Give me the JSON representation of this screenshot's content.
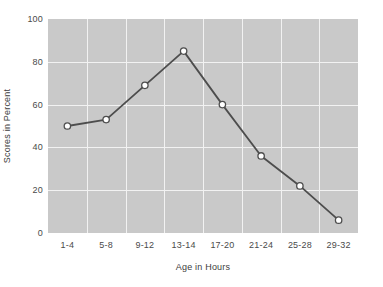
{
  "chart_data": {
    "type": "line",
    "title": "",
    "xlabel": "Age in Hours",
    "ylabel": "Scores in Percent",
    "categories": [
      "1-4",
      "5-8",
      "9-12",
      "13-14",
      "17-20",
      "21-24",
      "25-28",
      "29-32"
    ],
    "values": [
      50,
      53,
      69,
      85,
      60,
      36,
      22,
      6
    ],
    "series": [
      {
        "name": "Scores",
        "values": [
          50,
          53,
          69,
          85,
          60,
          36,
          22,
          6
        ]
      }
    ],
    "ylim": [
      0,
      100
    ],
    "yticks": [
      0,
      20,
      40,
      60,
      80,
      100
    ],
    "ytick_labels": [
      "0",
      "20",
      "40",
      "60",
      "80",
      "100"
    ],
    "grid": true,
    "grid_color": "#f2f2f2",
    "legend": null,
    "legend_position": "none",
    "plot_background": "#c9c9c9",
    "figure_background": "#ffffff",
    "line_color": "#4d4d4d",
    "marker": "open-circle",
    "marker_face_color": "#ffffff",
    "marker_edge_color": "#4d4d4d",
    "tick_label_color": "#4a4a4a",
    "axis_label_color": "#3d3d3d"
  }
}
